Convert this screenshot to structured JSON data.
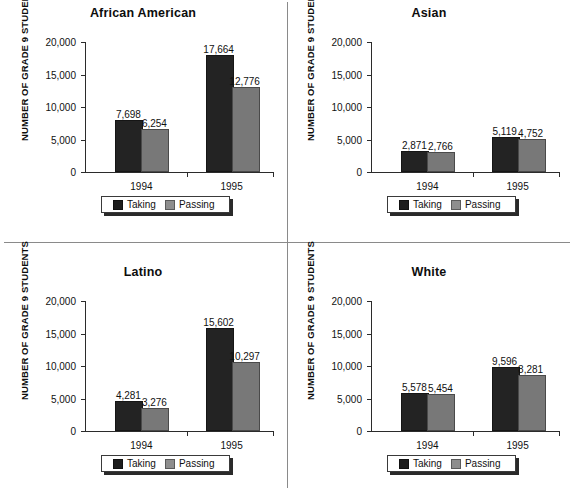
{
  "figure": {
    "axis_label": "NUMBER OF GRADE 9 STUDENTS",
    "legend": {
      "taking_label": "Taking",
      "passing_label": "Passing",
      "taking_swatch": "taking-color-swatch",
      "passing_swatch": "passing-color-swatch"
    },
    "colors": {
      "taking": "#232323",
      "passing": "#787878",
      "axis": "#2b2b2b",
      "divider": "#8a8a8a",
      "text": "#111111",
      "background": "#ffffff"
    },
    "y_ticks": [
      "0",
      "5,000",
      "10,000",
      "15,000",
      "20,000"
    ],
    "y_tick_values": [
      0,
      5000,
      10000,
      15000,
      20000
    ],
    "x_ticks": [
      "1994",
      "1995"
    ]
  },
  "chart_data": [
    {
      "type": "bar",
      "title": "African American",
      "xlabel": "",
      "ylabel": "NUMBER OF GRADE 9 STUDENTS",
      "ylim": [
        0,
        20000
      ],
      "yticks": [
        0,
        5000,
        10000,
        15000,
        20000
      ],
      "grid": false,
      "legend_position": "bottom-center",
      "categories": [
        "1994",
        "1995"
      ],
      "series": [
        {
          "name": "Taking",
          "values": [
            7698,
            6254
          ]
        },
        {
          "name": "Passing",
          "values": [
            0,
            0
          ]
        }
      ],
      "bars": [
        {
          "category": "1994",
          "series": "Taking",
          "value": 7698,
          "label": "7,698"
        },
        {
          "category": "1994",
          "series": "Passing",
          "value": 6254,
          "label": "6,254"
        },
        {
          "category": "1995",
          "series": "Taking",
          "value": 17664,
          "label": "17,664"
        },
        {
          "category": "1995",
          "series": "Passing",
          "value": 12776,
          "label": "12,776"
        }
      ]
    },
    {
      "type": "bar",
      "title": "Asian",
      "xlabel": "",
      "ylabel": "NUMBER OF GRADE 9 STUDENTS",
      "ylim": [
        0,
        20000
      ],
      "yticks": [
        0,
        5000,
        10000,
        15000,
        20000
      ],
      "grid": false,
      "legend_position": "bottom-center",
      "categories": [
        "1994",
        "1995"
      ],
      "bars": [
        {
          "category": "1994",
          "series": "Taking",
          "value": 2871,
          "label": "2,871"
        },
        {
          "category": "1994",
          "series": "Passing",
          "value": 2766,
          "label": "2,766"
        },
        {
          "category": "1995",
          "series": "Taking",
          "value": 5119,
          "label": "5,119"
        },
        {
          "category": "1995",
          "series": "Passing",
          "value": 4752,
          "label": "4,752"
        }
      ]
    },
    {
      "type": "bar",
      "title": "Latino",
      "xlabel": "",
      "ylabel": "NUMBER OF GRADE 9 STUDENTS",
      "ylim": [
        0,
        20000
      ],
      "yticks": [
        0,
        5000,
        10000,
        15000,
        20000
      ],
      "grid": false,
      "legend_position": "bottom-center",
      "categories": [
        "1994",
        "1995"
      ],
      "bars": [
        {
          "category": "1994",
          "series": "Taking",
          "value": 4281,
          "label": "4,281"
        },
        {
          "category": "1994",
          "series": "Passing",
          "value": 3276,
          "label": "3,276"
        },
        {
          "category": "1995",
          "series": "Taking",
          "value": 15602,
          "label": "15,602"
        },
        {
          "category": "1995",
          "series": "Passing",
          "value": 10297,
          "label": "10,297"
        }
      ]
    },
    {
      "type": "bar",
      "title": "White",
      "xlabel": "",
      "ylabel": "NUMBER OF GRADE 9 STUDENTS",
      "ylim": [
        0,
        20000
      ],
      "yticks": [
        0,
        5000,
        10000,
        15000,
        20000
      ],
      "grid": false,
      "legend_position": "bottom-center",
      "categories": [
        "1994",
        "1995"
      ],
      "bars": [
        {
          "category": "1994",
          "series": "Taking",
          "value": 5578,
          "label": "5,578"
        },
        {
          "category": "1994",
          "series": "Passing",
          "value": 5454,
          "label": "5,454"
        },
        {
          "category": "1995",
          "series": "Taking",
          "value": 9596,
          "label": "9,596"
        },
        {
          "category": "1995",
          "series": "Passing",
          "value": 8281,
          "label": "8,281"
        }
      ]
    }
  ]
}
